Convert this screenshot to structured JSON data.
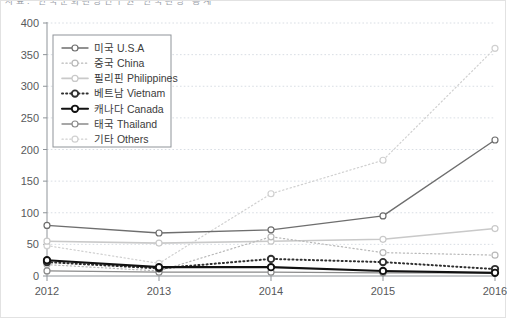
{
  "topbar": {
    "cut_text": "자료: 한국문화관광연구원 한국관광 통계"
  },
  "chart_data": {
    "type": "line",
    "title": "",
    "subtitle": "",
    "xlabel": "",
    "ylabel": "",
    "categories": [
      "2012",
      "2013",
      "2014",
      "2015",
      "2016"
    ],
    "x": [
      2012,
      2013,
      2014,
      2015,
      2016
    ],
    "ylim": [
      0,
      400
    ],
    "yticks": [
      0,
      50,
      100,
      150,
      200,
      250,
      300,
      350,
      400
    ],
    "ytick_labels": [
      "0",
      "50",
      "100",
      "150",
      "200",
      "250",
      "300",
      "350",
      "400"
    ],
    "grid": true,
    "grid_axis": "y",
    "legend_position": "upper-left-inside",
    "series": [
      {
        "name": "미국 U.S.A",
        "label_ko": "미국",
        "label_en": "U.S.A",
        "values": [
          80,
          68,
          73,
          95,
          215
        ],
        "color": "#6e6e6e",
        "style": "solid",
        "width": 1.4,
        "marker": "circle"
      },
      {
        "name": "중국 China",
        "label_ko": "중국",
        "label_en": "China",
        "values": [
          18,
          8,
          62,
          37,
          33
        ],
        "color": "#b8b8b8",
        "style": "dotted",
        "width": 1.2,
        "marker": "circle"
      },
      {
        "name": "필리핀 Philippines",
        "label_ko": "필리핀",
        "label_en": "Philippines",
        "values": [
          55,
          52,
          55,
          58,
          75
        ],
        "color": "#c9c9c9",
        "style": "solid",
        "width": 1.6,
        "marker": "circle"
      },
      {
        "name": "베트남 Vietnam",
        "label_ko": "베트남",
        "label_en": "Vietnam",
        "values": [
          22,
          12,
          27,
          22,
          11
        ],
        "color": "#2f2f2f",
        "style": "dotted-thick",
        "width": 2.0,
        "marker": "circle"
      },
      {
        "name": "캐나다 Canada",
        "label_ko": "캐나다",
        "label_en": "Canada",
        "values": [
          25,
          14,
          14,
          8,
          5
        ],
        "color": "#111111",
        "style": "solid",
        "width": 2.1,
        "marker": "circle"
      },
      {
        "name": "태국 Thailand",
        "label_ko": "태국",
        "label_en": "Thailand",
        "values": [
          8,
          6,
          6,
          5,
          5
        ],
        "color": "#8a8a8a",
        "style": "solid",
        "width": 1.3,
        "marker": "circle"
      },
      {
        "name": "기타 Others",
        "label_ko": "기타",
        "label_en": "Others",
        "values": [
          48,
          20,
          130,
          183,
          360
        ],
        "color": "#d0d0d0",
        "style": "dotted",
        "width": 1.2,
        "marker": "circle"
      }
    ]
  }
}
